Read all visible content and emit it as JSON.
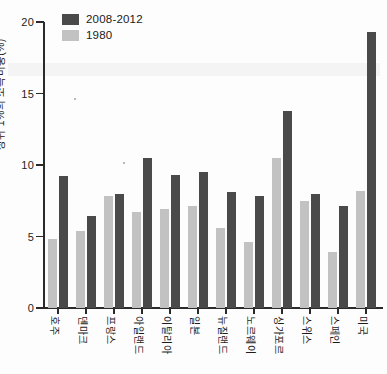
{
  "chart_data": {
    "type": "bar",
    "title": "",
    "xlabel": "",
    "ylabel": "상위 1%의 소득비중(%)",
    "ylim": [
      0,
      20
    ],
    "yticks": [
      0,
      5,
      10,
      15,
      20
    ],
    "ytick_labels": [
      "0",
      "5",
      "10",
      "15",
      "20"
    ],
    "grid": false,
    "legend_position": "top-left",
    "categories": [
      "호주",
      "덴마크",
      "프랑스",
      "아일랜드",
      "이탈리아",
      "일본",
      "뉴질랜드",
      "노르웨이",
      "싱가포르",
      "스위스",
      "스페인",
      "미국"
    ],
    "series": [
      {
        "name": "2008-2012",
        "color": "#4a4a4a",
        "values": [
          9.2,
          6.4,
          8.0,
          10.5,
          9.3,
          9.5,
          8.1,
          7.8,
          13.8,
          8.0,
          7.1,
          19.3
        ]
      },
      {
        "name": "1980",
        "color": "#c2c2c2",
        "values": [
          4.8,
          5.4,
          7.8,
          6.7,
          6.9,
          7.1,
          5.6,
          4.6,
          10.5,
          7.5,
          3.9,
          8.2
        ]
      }
    ]
  },
  "legend": {
    "items": [
      {
        "label": "2008-2012",
        "swatch": "dark"
      },
      {
        "label": "1980",
        "swatch": "light"
      }
    ]
  },
  "axis": {
    "y_title": "상위 1%의 소득비중(%)"
  }
}
